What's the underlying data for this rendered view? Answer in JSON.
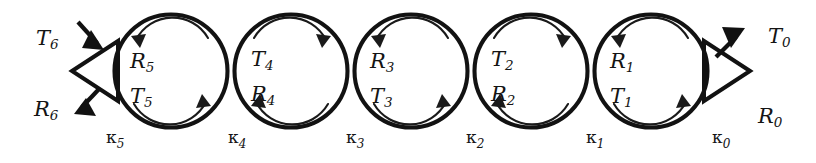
{
  "figure": {
    "type": "diagram",
    "background_color": "#ffffff",
    "stroke_color": "#121212",
    "width": 816,
    "height": 163
  },
  "external_ports": {
    "left": {
      "name": "input-port",
      "triangle_direction": "left",
      "incoming": {
        "label": "T",
        "subscript": "6",
        "arrow_direction": "down-right",
        "arrow_style": "solid-filled"
      },
      "outgoing": {
        "label": "R",
        "subscript": "6",
        "arrow_direction": "down-left",
        "arrow_style": "solid-filled"
      }
    },
    "right": {
      "name": "output-port",
      "triangle_direction": "right",
      "outgoing": {
        "label": "T",
        "subscript": "0",
        "arrow_direction": "up-right",
        "arrow_style": "solid-filled"
      },
      "reflection": {
        "label": "R",
        "subscript": "0",
        "arrow_direction": "none",
        "arrow_style": "none"
      }
    }
  },
  "circles": [
    {
      "index": 0,
      "cx": 171,
      "cy": 71,
      "r": 56.5,
      "curvature_label": "κ",
      "curvature_subscript": "5",
      "top_label": "R",
      "top_subscript": "5",
      "bottom_label": "T",
      "bottom_subscript": "5",
      "top_arrow_direction": "left",
      "bottom_arrow_direction": "right",
      "rotation_sense": "counterclockwise"
    },
    {
      "index": 1,
      "cx": 291,
      "cy": 71,
      "r": 56.5,
      "curvature_label": "κ",
      "curvature_subscript": "4",
      "top_label": "T",
      "top_subscript": "4",
      "bottom_label": "R",
      "bottom_subscript": "4",
      "top_arrow_direction": "right",
      "bottom_arrow_direction": "left",
      "rotation_sense": "clockwise"
    },
    {
      "index": 2,
      "cx": 411,
      "cy": 71,
      "r": 56.5,
      "curvature_label": "κ",
      "curvature_subscript": "3",
      "top_label": "R",
      "top_subscript": "3",
      "bottom_label": "T",
      "bottom_subscript": "3",
      "top_arrow_direction": "left",
      "bottom_arrow_direction": "right",
      "rotation_sense": "counterclockwise"
    },
    {
      "index": 3,
      "cx": 531,
      "cy": 71,
      "r": 56.5,
      "curvature_label": "κ",
      "curvature_subscript": "2",
      "top_label": "T",
      "top_subscript": "2",
      "bottom_label": "R",
      "bottom_subscript": "2",
      "top_arrow_direction": "right",
      "bottom_arrow_direction": "left",
      "rotation_sense": "clockwise"
    },
    {
      "index": 4,
      "cx": 651,
      "cy": 71,
      "r": 56.5,
      "curvature_label": "κ",
      "curvature_subscript": "1",
      "top_label": "R",
      "top_subscript": "1",
      "bottom_label": "T",
      "bottom_subscript": "1",
      "top_arrow_direction": "left",
      "bottom_arrow_direction": "right",
      "rotation_sense": "counterclockwise"
    }
  ],
  "trailing_curvature": {
    "label": "κ",
    "subscript": "0"
  }
}
